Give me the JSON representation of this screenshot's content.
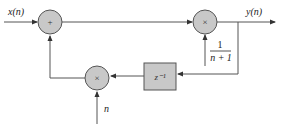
{
  "diagram": {
    "type": "block-diagram",
    "input_label": "x(n)",
    "output_label": "y(n)",
    "adder_symbol": "+",
    "multiplier_top_symbol": "×",
    "multiplier_bottom_symbol": "×",
    "delay_label": "z⁻¹",
    "gain_numerator": "1",
    "gain_denominator": "n + 1",
    "bottom_input_label": "n",
    "colors": {
      "node_fill": "#c8c8c8",
      "stroke": "#555555"
    }
  }
}
